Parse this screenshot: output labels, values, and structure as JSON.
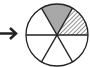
{
  "diagram": {
    "type": "fraction-circle",
    "total_sectors": 6,
    "sectors": [
      {
        "index": 0,
        "fill": "gray"
      },
      {
        "index": 1,
        "fill": "hatched"
      },
      {
        "index": 2,
        "fill": "white"
      },
      {
        "index": 3,
        "fill": "white"
      },
      {
        "index": 4,
        "fill": "white"
      },
      {
        "index": 5,
        "fill": "white"
      }
    ],
    "colors": {
      "stroke": "#222222",
      "gray_fill": "#a8a8a8",
      "hatch": "#222222",
      "background": "#ffffff"
    },
    "arrow": {
      "direction": "right"
    }
  }
}
